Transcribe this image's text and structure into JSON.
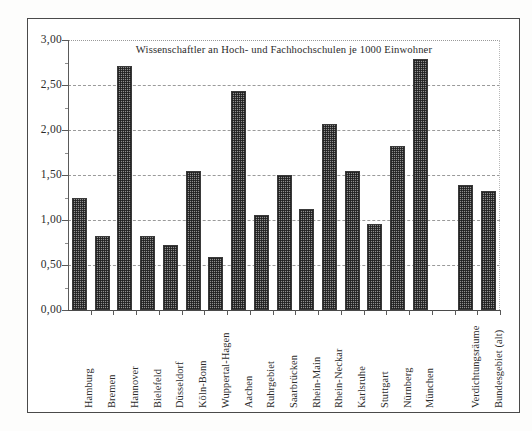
{
  "figure": {
    "border_color": "#4a4a4a",
    "background": "#ffffff"
  },
  "chart_data": {
    "type": "bar",
    "title": "Wissenschaftler an Hoch- und Fachhochschulen je 1000 Einwohner",
    "xlabel": "",
    "ylabel": "",
    "ylim": [
      0,
      3
    ],
    "ytick_values": [
      0,
      0.5,
      1,
      1.5,
      2,
      2.5,
      3
    ],
    "ytick_labels": [
      "0,00",
      "0,50",
      "1,00",
      "1,50",
      "2,00",
      "2,50",
      "3,00"
    ],
    "grid": true,
    "legend": "none",
    "decimal_separator": ",",
    "bar_color": "#8e8e8e",
    "bar_edge_color": "#3a3a3a",
    "bar_fill_pattern": "fine-checkered-halftone",
    "categories": [
      "Hamburg",
      "Bremen",
      "Hannover",
      "Bielefeld",
      "Düsseldorf",
      "Köln-Bonn",
      "Wuppertal-Hagen",
      "Aachen",
      "Ruhrgebiet",
      "Saarbrücken",
      "Rhein-Main",
      "Rhein-Neckar",
      "Karlsruhe",
      "Stuttgart",
      "Nürnberg",
      "München",
      "",
      "Verdichtungsräume",
      "Bundesgebiet (alt)"
    ],
    "values": [
      1.24,
      0.82,
      2.71,
      0.82,
      0.72,
      1.55,
      0.59,
      2.43,
      1.06,
      1.5,
      1.12,
      2.07,
      1.55,
      0.96,
      1.82,
      2.79,
      null,
      1.39,
      1.32
    ]
  }
}
